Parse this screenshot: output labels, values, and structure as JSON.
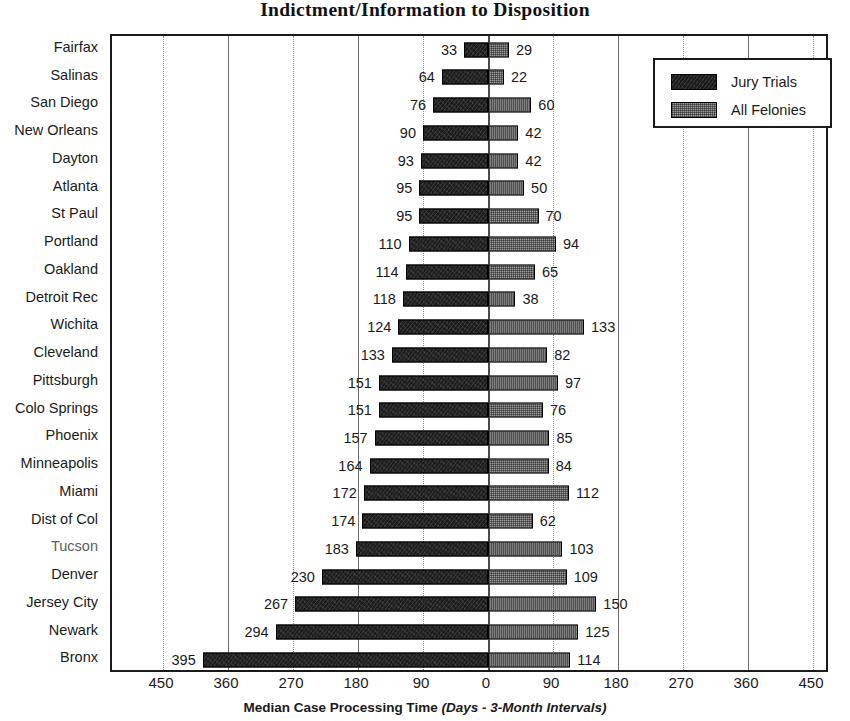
{
  "chart_data": {
    "type": "bar",
    "orientation": "horizontal",
    "layout": "diverging-bidirectional",
    "title": "Indictment/Information to Disposition",
    "xlabel_main": "Median Case Processing Time",
    "xlabel_note": "(Days - 3-Month Intervals)",
    "ylabel": "",
    "grid": true,
    "legend_position": "top-right",
    "xlim": [
      -450,
      450
    ],
    "xticks": [
      "450",
      "360",
      "270",
      "180",
      "90",
      "0",
      "90",
      "180",
      "270",
      "360",
      "450"
    ],
    "xtick_values": [
      -450,
      -360,
      -270,
      -180,
      -90,
      0,
      90,
      180,
      270,
      360,
      450
    ],
    "categories": [
      "Fairfax",
      "Salinas",
      "San Diego",
      "New Orleans",
      "Dayton",
      "Atlanta",
      "St Paul",
      "Portland",
      "Oakland",
      "Detroit Rec",
      "Wichita",
      "Cleveland",
      "Pittsburgh",
      "Colo Springs",
      "Phoenix",
      "Minneapolis",
      "Miami",
      "Dist of Col",
      "Tucson",
      "Denver",
      "Jersey City",
      "Newark",
      "Bronx"
    ],
    "series": [
      {
        "name": "Jury Trials",
        "direction": "left",
        "color": "#1c1c1c",
        "values": [
          33,
          64,
          76,
          90,
          93,
          95,
          95,
          110,
          114,
          118,
          124,
          133,
          151,
          151,
          157,
          164,
          172,
          174,
          183,
          230,
          267,
          294,
          395
        ]
      },
      {
        "name": "All Felonies",
        "direction": "right",
        "color": "#9c9c9c",
        "values": [
          29,
          22,
          60,
          42,
          42,
          50,
          70,
          94,
          65,
          38,
          133,
          82,
          97,
          76,
          85,
          84,
          112,
          62,
          103,
          109,
          150,
          125,
          114
        ]
      }
    ]
  },
  "legend": {
    "items": [
      {
        "label": "Jury Trials",
        "swatch": "jury"
      },
      {
        "label": "All Felonies",
        "swatch": "felony"
      }
    ]
  }
}
